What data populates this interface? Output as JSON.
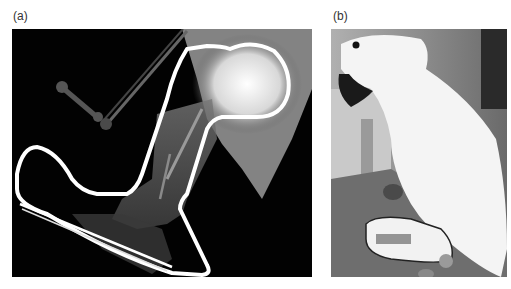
{
  "figure": {
    "panels": [
      {
        "label": "(a)",
        "description": "Radiograph of bird leg with wire splint outline",
        "background": "#020202"
      },
      {
        "label": "(b)",
        "description": "Photograph of white cockatoo wearing leg splint",
        "background": "#8a8a8a"
      }
    ]
  }
}
